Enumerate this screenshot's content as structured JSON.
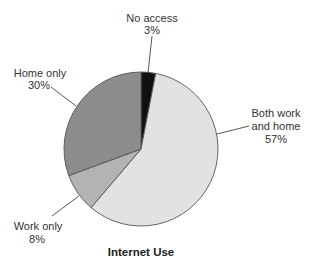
{
  "chart_data": {
    "type": "pie",
    "title": "Internet Use",
    "start_angle_deg": 0,
    "direction": "clockwise",
    "legend": "none (callout labels)",
    "slices": [
      {
        "label": "No access",
        "value": 3,
        "value_label": "3%",
        "color": "#111111"
      },
      {
        "label": "Both work and home",
        "value": 57,
        "value_label": "57%",
        "color": "#e2e2e2"
      },
      {
        "label": "Work only",
        "value": 8,
        "value_label": "8%",
        "color": "#b3b3b3"
      },
      {
        "label": "Home only",
        "value": 30,
        "value_label": "30%",
        "color": "#8c8c8c"
      }
    ]
  },
  "labels": {
    "no_access": {
      "line1": "No access",
      "line2": "3%"
    },
    "both": {
      "line1": "Both work",
      "line2": "and home",
      "line3": "57%"
    },
    "work_only": {
      "line1": "Work only",
      "line2": "8%"
    },
    "home_only": {
      "line1": "Home only",
      "line2": "30%"
    }
  },
  "title": "Internet Use"
}
